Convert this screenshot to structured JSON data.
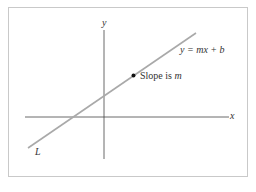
{
  "diagram": {
    "title": "",
    "axes": {
      "x_label": "x",
      "y_label": "y"
    },
    "line": {
      "name": "L",
      "equation": "y = mx + b",
      "color": "#a9a9a9"
    },
    "point": {
      "annotation": "Slope is m",
      "slope_symbol": "m",
      "prefix": "Slope is "
    },
    "colors": {
      "axis": "#444444",
      "frame": "#c9c9c9",
      "line": "#a9a9a9"
    }
  }
}
